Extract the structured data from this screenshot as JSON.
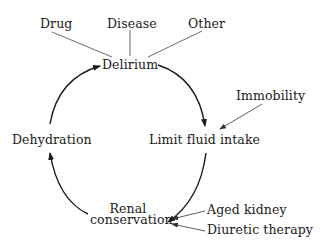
{
  "diagram": {
    "nodes": {
      "delirium": "Delirium",
      "limit_fluid_intake": "Limit fluid intake",
      "renal_conservation_line1": "Renal",
      "renal_conservation_line2": "conservation",
      "dehydration": "Dehydration"
    },
    "delirium_causes": [
      "Drug",
      "Disease",
      "Other"
    ],
    "fluid_intake_factors": [
      "Immobility"
    ],
    "renal_factors": [
      "Aged kidney",
      "Diuretic therapy"
    ],
    "cycle": [
      "Delirium",
      "Limit fluid intake",
      "Renal conservation",
      "Dehydration",
      "Delirium"
    ]
  }
}
